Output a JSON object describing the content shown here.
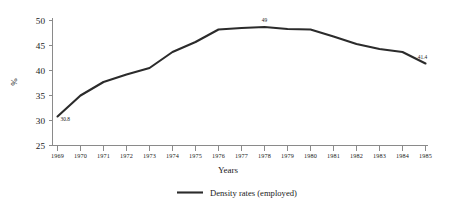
{
  "chart_data": {
    "type": "line",
    "title": "",
    "xlabel": "Years",
    "ylabel": "%",
    "x": [
      1969,
      1970,
      1971,
      1972,
      1973,
      1974,
      1975,
      1976,
      1977,
      1978,
      1979,
      1980,
      1981,
      1982,
      1983,
      1984,
      1985
    ],
    "categories": [
      "1969",
      "1970",
      "1971",
      "1972",
      "1973",
      "1974",
      "1975",
      "1976",
      "1977",
      "1978",
      "1979",
      "1980",
      "1981",
      "1982",
      "1983",
      "1984",
      "1985"
    ],
    "series": [
      {
        "name": "Density rates (employed)",
        "values": [
          30.8,
          35.0,
          37.7,
          39.2,
          40.5,
          43.7,
          45.7,
          48.2,
          48.5,
          48.7,
          48.3,
          48.2,
          46.8,
          45.3,
          44.3,
          43.7,
          41.4
        ]
      }
    ],
    "ylim": [
      25,
      50
    ],
    "yticks": [
      25,
      30,
      35,
      40,
      45,
      50
    ],
    "ytick_labels": [
      "25",
      "30",
      "35",
      "40",
      "45",
      "50"
    ],
    "xlim": [
      1969,
      1985
    ],
    "grid": false,
    "legend_position": "bottom-center",
    "annotations": [
      {
        "text": "30.8",
        "x": 1969,
        "y": 30.8
      },
      {
        "text": "49",
        "x": 1978,
        "y": 48.7
      },
      {
        "text": "41.4",
        "x": 1985,
        "y": 41.4
      }
    ],
    "colors": {
      "line": "#2b2b2b",
      "axis": "#8a8a8a",
      "text": "#1a1a1a",
      "background": "#ffffff"
    }
  },
  "legend": {
    "entries": [
      {
        "label": "Density rates (employed)"
      }
    ]
  }
}
